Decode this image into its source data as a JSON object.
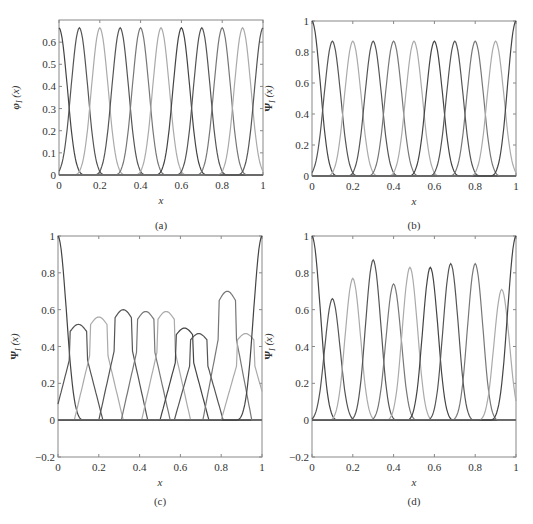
{
  "chart_data": [
    {
      "panel": "(a)",
      "type": "line",
      "title": "",
      "xlabel": "x",
      "ylabel": "φI (x)",
      "xlim": [
        0,
        1
      ],
      "ylim": [
        0,
        0.7
      ],
      "xticks": [
        "0",
        "0.2",
        "0.4",
        "0.6",
        "0.8",
        "1"
      ],
      "yticks": [
        "0",
        "0.1",
        "0.2",
        "0.3",
        "0.4",
        "0.5",
        "0.6"
      ],
      "grid": false,
      "legend": null,
      "description": "11 identical bell-shaped basis functions centered at x = 0, 0.1, ..., 1.0, each with peak 0.665, half-width ≈ 0.1",
      "series": {
        "centers": [
          0,
          0.1,
          0.2,
          0.3,
          0.4,
          0.5,
          0.6,
          0.7,
          0.8,
          0.9,
          1.0
        ],
        "peak": 0.665,
        "support_halfwidth": 0.13
      }
    },
    {
      "panel": "(b)",
      "type": "line",
      "xlabel": "x",
      "ylabel": "ΨI (x)",
      "xlim": [
        0,
        1
      ],
      "ylim": [
        0,
        1
      ],
      "xticks": [
        "0",
        "0.2",
        "0.4",
        "0.6",
        "0.8",
        "1"
      ],
      "yticks": [
        "0",
        "0.2",
        "0.4",
        "0.6",
        "0.8",
        "1"
      ],
      "grid": false,
      "legend": null,
      "description": "Shape functions; interior peaks 0.87 at x = 0.1..0.9, boundary functions reach 1.0 at x = 0 and x = 1",
      "series": {
        "centers": [
          0.1,
          0.2,
          0.3,
          0.4,
          0.5,
          0.6,
          0.7,
          0.8,
          0.9
        ],
        "peaks": [
          0.87,
          0.87,
          0.87,
          0.87,
          0.87,
          0.87,
          0.87,
          0.87,
          0.87
        ],
        "boundary_peak": 1.0
      }
    },
    {
      "panel": "(c)",
      "type": "line",
      "xlabel": "x",
      "ylabel": "ΨI (x)",
      "xlim": [
        0,
        1
      ],
      "ylim": [
        -0.2,
        1
      ],
      "xticks": [
        "0",
        "0.2",
        "0.4",
        "0.6",
        "0.8",
        "1"
      ],
      "yticks": [
        "-0.2",
        "0",
        "0.2",
        "0.4",
        "0.6",
        "0.8",
        "1"
      ],
      "grid": false,
      "legend": null,
      "description": "Irregular (non-uniform node) shape functions with kinked peaks",
      "series": {
        "centers": [
          0.1,
          0.2,
          0.32,
          0.43,
          0.53,
          0.62,
          0.69,
          0.83,
          0.92
        ],
        "peaks": [
          0.52,
          0.56,
          0.6,
          0.59,
          0.59,
          0.5,
          0.47,
          0.7,
          0.47
        ],
        "boundary_peak": 1.0
      }
    },
    {
      "panel": "(d)",
      "type": "line",
      "xlabel": "x",
      "ylabel": "ΨI (x)",
      "xlim": [
        0,
        1
      ],
      "ylim": [
        -0.2,
        1
      ],
      "xticks": [
        "0",
        "0.2",
        "0.4",
        "0.6",
        "0.8",
        "1"
      ],
      "yticks": [
        "-0.2",
        "0",
        "0.2",
        "0.4",
        "0.6",
        "0.8",
        "1"
      ],
      "grid": false,
      "legend": null,
      "description": "Smooth shape functions on non-uniform nodes",
      "series": {
        "centers": [
          0.1,
          0.2,
          0.3,
          0.4,
          0.48,
          0.58,
          0.68,
          0.8,
          0.93
        ],
        "peaks": [
          0.66,
          0.77,
          0.87,
          0.74,
          0.83,
          0.83,
          0.85,
          0.85,
          0.71
        ],
        "boundary_peak": 1.0
      }
    }
  ],
  "captions": [
    "(a)",
    "(b)",
    "(c)",
    "(d)"
  ],
  "axis_x_label": "x",
  "ylabel_a": "φ",
  "ylabel_psi": "Ψ",
  "ylabel_sub": "I",
  "ylabel_arg": "(x)"
}
